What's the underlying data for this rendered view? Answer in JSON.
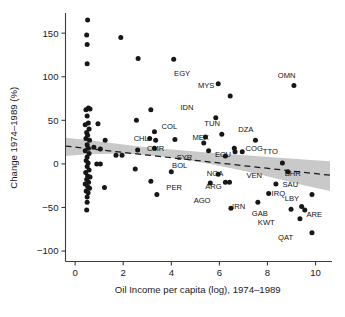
{
  "chart_data": {
    "type": "scatter",
    "title": "",
    "xlabel": "Oil Income per capita (log), 1974–1989",
    "ylabel": "Change 1974–1989 (%)",
    "xlim": [
      -0.4,
      10.6
    ],
    "ylim": [
      -112,
      172
    ],
    "xticks": [
      0,
      2,
      4,
      6,
      8,
      10
    ],
    "yticks": [
      -100,
      -50,
      0,
      50,
      100,
      150
    ],
    "xticklabels": [
      "0",
      "2",
      "4",
      "6",
      "8",
      "10"
    ],
    "yticklabels": [
      "-100",
      "-50",
      "0",
      "50",
      "100",
      "150"
    ],
    "grid": false,
    "legend": null,
    "marker_color": "#171717",
    "band_color": "#b4b4b4",
    "fit_line_style": "dashed",
    "fit_line": {
      "x": [
        -0.4,
        10.6
      ],
      "y": [
        20.5,
        -13.0
      ],
      "note": "dashed linear fit, negative slope"
    },
    "confidence_band": {
      "x": [
        -0.4,
        0.5,
        1.5,
        2.5,
        3.4,
        4.5,
        5.5,
        6.5,
        7.5,
        8.5,
        9.5,
        10.6
      ],
      "upper": [
        30.0,
        27.5,
        24.0,
        20.5,
        18.0,
        15.5,
        13.0,
        11.0,
        9.0,
        7.0,
        5.0,
        3.0
      ],
      "lower": [
        9.0,
        11.0,
        11.5,
        11.0,
        9.0,
        5.0,
        0.5,
        -5.0,
        -11.0,
        -17.5,
        -24.5,
        -31.0
      ]
    },
    "labeled_points": [
      {
        "label": "EGY",
        "x": 5.95,
        "y": 92,
        "label_dx": -1.5,
        "label_dy": 9
      },
      {
        "label": "MYS",
        "x": 6.45,
        "y": 78,
        "label_dx": -1.0,
        "label_dy": 9
      },
      {
        "label": "OMN",
        "x": 9.1,
        "y": 90,
        "label_dx": -0.3,
        "label_dy": 9
      },
      {
        "label": "IDN",
        "x": 5.85,
        "y": 53,
        "label_dx": -1.2,
        "label_dy": 9
      },
      {
        "label": "TUN",
        "x": 6.1,
        "y": 34,
        "label_dx": -0.4,
        "label_dy": 10
      },
      {
        "label": "COL",
        "x": 5.42,
        "y": 31,
        "label_dx": -1.5,
        "label_dy": 9
      },
      {
        "label": "DZA",
        "x": 7.5,
        "y": 27,
        "label_dx": -0.4,
        "label_dy": 10
      },
      {
        "label": "CHL",
        "x": 5.35,
        "y": 24,
        "label_dx": -2.6,
        "label_dy": 2
      },
      {
        "label": "MEX",
        "x": 6.62,
        "y": 18,
        "label_dx": -1.4,
        "label_dy": 9
      },
      {
        "label": "CMR",
        "x": 5.55,
        "y": 15,
        "label_dx": -2.2,
        "label_dy": 0
      },
      {
        "label": "COG",
        "x": 6.95,
        "y": 14,
        "label_dx": 0.5,
        "label_dy": 1
      },
      {
        "label": "ECU",
        "x": 6.65,
        "y": 14,
        "label_dx": -0.5,
        "label_dy": -6
      },
      {
        "label": "SYR",
        "x": 6.25,
        "y": 9,
        "label_dx": -1.7,
        "label_dy": -4
      },
      {
        "label": "TTO",
        "x": 8.62,
        "y": 1,
        "label_dx": -0.5,
        "label_dy": 10
      },
      {
        "label": "BOL",
        "x": 5.95,
        "y": -12,
        "label_dx": -1.6,
        "label_dy": 7
      },
      {
        "label": "BHR",
        "x": 8.85,
        "y": -9,
        "label_dx": 0.2,
        "label_dy": -5
      },
      {
        "label": "NGA",
        "x": 6.42,
        "y": -21,
        "label_dx": -0.6,
        "label_dy": 7
      },
      {
        "label": "VEN",
        "x": 8.35,
        "y": -23,
        "label_dx": -0.9,
        "label_dy": 7
      },
      {
        "label": "SAU",
        "x": 9.85,
        "y": -35,
        "label_dx": -0.9,
        "label_dy": 8
      },
      {
        "label": "ARG",
        "x": 6.25,
        "y": -21,
        "label_dx": -0.5,
        "label_dy": -8
      },
      {
        "label": "PER",
        "x": 5.62,
        "y": -22,
        "label_dx": -1.5,
        "label_dy": -8
      },
      {
        "label": "IRQ",
        "x": 8.05,
        "y": -34,
        "label_dx": 0.4,
        "label_dy": -3
      },
      {
        "label": "AGO",
        "x": 6.48,
        "y": -51,
        "label_dx": -1.2,
        "label_dy": 6
      },
      {
        "label": "IRN",
        "x": 7.6,
        "y": -44,
        "label_dx": -0.8,
        "label_dy": -8
      },
      {
        "label": "LBY",
        "x": 9.42,
        "y": -49,
        "label_dx": -0.4,
        "label_dy": 6
      },
      {
        "label": "GAB",
        "x": 8.98,
        "y": -52,
        "label_dx": -1.3,
        "label_dy": -8
      },
      {
        "label": "ARE",
        "x": 9.55,
        "y": -53,
        "label_dx": 0.4,
        "label_dy": -8
      },
      {
        "label": "KWT",
        "x": 9.35,
        "y": -63,
        "label_dx": -1.4,
        "label_dy": -7
      },
      {
        "label": "QAT",
        "x": 9.85,
        "y": -79,
        "label_dx": -1.1,
        "label_dy": -8
      }
    ],
    "unlabeled_points": [
      {
        "x": 0.52,
        "y": 165
      },
      {
        "x": 0.48,
        "y": 148
      },
      {
        "x": 0.5,
        "y": 137
      },
      {
        "x": 0.5,
        "y": 115
      },
      {
        "x": 1.9,
        "y": 145
      },
      {
        "x": 2.62,
        "y": 121
      },
      {
        "x": 4.1,
        "y": 120
      },
      {
        "x": 0.55,
        "y": 64
      },
      {
        "x": 0.45,
        "y": 62
      },
      {
        "x": 0.62,
        "y": 63
      },
      {
        "x": 0.5,
        "y": 55
      },
      {
        "x": 0.55,
        "y": 47
      },
      {
        "x": 0.42,
        "y": 45
      },
      {
        "x": 0.58,
        "y": 40
      },
      {
        "x": 0.48,
        "y": 36
      },
      {
        "x": 0.52,
        "y": 33
      },
      {
        "x": 0.45,
        "y": 29
      },
      {
        "x": 0.6,
        "y": 27
      },
      {
        "x": 0.5,
        "y": 22
      },
      {
        "x": 0.55,
        "y": 18
      },
      {
        "x": 0.42,
        "y": 15
      },
      {
        "x": 0.58,
        "y": 12
      },
      {
        "x": 0.5,
        "y": 8
      },
      {
        "x": 0.46,
        "y": 4
      },
      {
        "x": 0.54,
        "y": 1
      },
      {
        "x": 0.5,
        "y": -3
      },
      {
        "x": 0.58,
        "y": -7
      },
      {
        "x": 0.44,
        "y": -10
      },
      {
        "x": 0.52,
        "y": -14
      },
      {
        "x": 0.62,
        "y": -15
      },
      {
        "x": 0.48,
        "y": -18
      },
      {
        "x": 0.56,
        "y": -21
      },
      {
        "x": 0.42,
        "y": -23
      },
      {
        "x": 0.52,
        "y": -26
      },
      {
        "x": 0.6,
        "y": -28
      },
      {
        "x": 0.46,
        "y": -31
      },
      {
        "x": 0.54,
        "y": -33
      },
      {
        "x": 0.5,
        "y": -38
      },
      {
        "x": 0.5,
        "y": -44
      },
      {
        "x": 0.48,
        "y": -53
      },
      {
        "x": 0.95,
        "y": 46
      },
      {
        "x": 1.25,
        "y": 27
      },
      {
        "x": 1.22,
        "y": -27
      },
      {
        "x": 1.7,
        "y": 10
      },
      {
        "x": 1.95,
        "y": 10
      },
      {
        "x": 2.55,
        "y": 50
      },
      {
        "x": 2.6,
        "y": 16
      },
      {
        "x": 2.5,
        "y": -6
      },
      {
        "x": 3.15,
        "y": 62
      },
      {
        "x": 3.3,
        "y": 37
      },
      {
        "x": 3.1,
        "y": 29
      },
      {
        "x": 3.35,
        "y": 27
      },
      {
        "x": 3.3,
        "y": 18
      },
      {
        "x": 3.15,
        "y": -20
      },
      {
        "x": 3.4,
        "y": -35
      },
      {
        "x": 4.15,
        "y": 28
      },
      {
        "x": 4.0,
        "y": -9
      },
      {
        "x": 1.05,
        "y": 17
      },
      {
        "x": 0.78,
        "y": 19
      },
      {
        "x": 0.9,
        "y": 0
      },
      {
        "x": 1.05,
        "y": 0
      }
    ]
  }
}
